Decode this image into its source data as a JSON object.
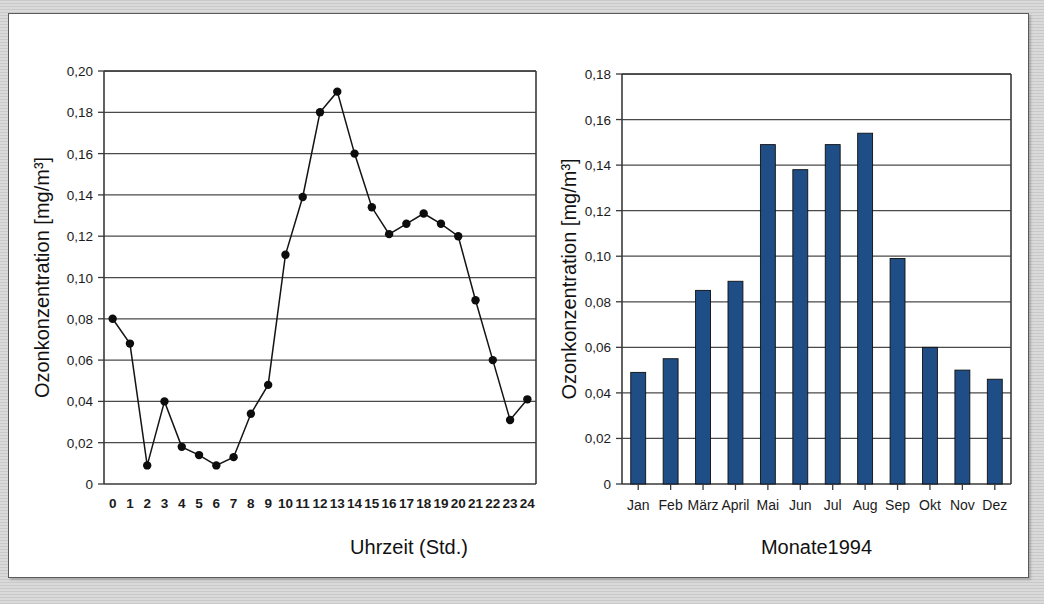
{
  "page": {
    "background_color": "#d2d2d2",
    "paper_color": "#ffffff",
    "border_color": "#5a5a5a"
  },
  "chart_data": [
    {
      "id": "ozone-daily-profile",
      "type": "line",
      "title": "",
      "xlabel": "Uhrzeit (Std.)",
      "ylabel": "Ozonkonzentration [mg/m³]",
      "x": [
        0,
        1,
        2,
        3,
        4,
        5,
        6,
        7,
        8,
        9,
        10,
        11,
        12,
        13,
        14,
        15,
        16,
        17,
        18,
        19,
        20,
        21,
        22,
        23,
        24
      ],
      "xtick_labels": [
        "0",
        "1",
        "2",
        "3",
        "4",
        "5",
        "6",
        "7",
        "8",
        "9",
        "10",
        "11",
        "12",
        "13",
        "14",
        "15",
        "16",
        "17",
        "18",
        "19",
        "20",
        "21",
        "22",
        "23",
        "24"
      ],
      "values": [
        0.08,
        0.068,
        0.009,
        0.04,
        0.018,
        0.014,
        0.009,
        0.013,
        0.034,
        0.048,
        0.111,
        0.139,
        0.18,
        0.19,
        0.16,
        0.134,
        0.121,
        0.126,
        0.131,
        0.126,
        0.12,
        0.089,
        0.06,
        0.031,
        0.041
      ],
      "ylim": [
        0,
        0.2
      ],
      "ytick_values": [
        0,
        0.02,
        0.04,
        0.06,
        0.08,
        0.1,
        0.12,
        0.14,
        0.16,
        0.18,
        0.2
      ],
      "ytick_labels": [
        "0",
        "0,02",
        "0,04",
        "0,06",
        "0,08",
        "0,10",
        "0,12",
        "0,14",
        "0,16",
        "0,18",
        "0,20"
      ],
      "grid": true,
      "legend": "none",
      "line_color": "#141414",
      "marker_color": "#0d0d0d",
      "marker": "circle"
    },
    {
      "id": "ozone-monthly-means",
      "type": "bar",
      "title": "",
      "xlabel": "Monate1994",
      "ylabel": "Ozonkonzentration [mg/m³]",
      "categories": [
        "Jan",
        "Feb",
        "März",
        "April",
        "Mai",
        "Jun",
        "Jul",
        "Aug",
        "Sep",
        "Okt",
        "Nov",
        "Dez"
      ],
      "values": [
        0.049,
        0.055,
        0.085,
        0.089,
        0.149,
        0.138,
        0.149,
        0.154,
        0.099,
        0.06,
        0.05,
        0.046
      ],
      "ylim": [
        0,
        0.18
      ],
      "ytick_values": [
        0,
        0.02,
        0.04,
        0.06,
        0.08,
        0.1,
        0.12,
        0.14,
        0.16,
        0.18
      ],
      "ytick_labels": [
        "0",
        "0,02",
        "0,04",
        "0,06",
        "0,08",
        "0,10",
        "0,12",
        "0,14",
        "0,16",
        "0,18"
      ],
      "grid": true,
      "legend": "none",
      "bar_color": "#1f4e87",
      "bar_edge_color": "#0f0f0f"
    }
  ]
}
